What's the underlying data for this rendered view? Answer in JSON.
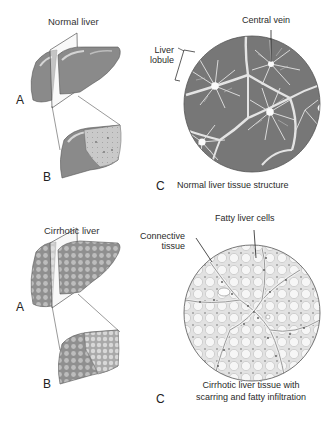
{
  "figure": {
    "normal": {
      "title": "Normal liver",
      "label_a": "A",
      "label_b": "B",
      "label_c": "C",
      "caption_c": "Normal liver tissue structure",
      "annotations": {
        "central_vein": "Central vein",
        "liver_lobule_line1": "Liver",
        "liver_lobule_line2": "lobule"
      }
    },
    "cirrhotic": {
      "title": "Cirrhotic liver",
      "label_a": "A",
      "label_b": "B",
      "label_c": "C",
      "caption_c_line1": "Cirrhotic liver tissue with",
      "caption_c_line2": "scarring and fatty infiltration",
      "annotations": {
        "fatty_cells": "Fatty liver cells",
        "connective_line1": "Connective",
        "connective_line2": "tissue"
      }
    },
    "colors": {
      "liver_fill": "#8a8a8a",
      "liver_highlight": "#c8c8c8",
      "cut_surface": "#bdbdbd",
      "tissue_dark": "#6e6e6e",
      "tissue_light": "#e9e9e9",
      "line": "#333333"
    }
  }
}
